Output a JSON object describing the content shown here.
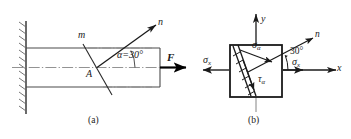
{
  "figure": {
    "captions": {
      "a": "(a)",
      "b": "(b)"
    },
    "panel_a": {
      "name": "cantilever-bar-panel",
      "support": "fixed-wall-hatched",
      "labels": {
        "section_top": "m",
        "section_point": "A",
        "normal_axis": "n",
        "angle": "α=30°",
        "force": "F"
      },
      "angle_value": 30,
      "angle_unit": "degree"
    },
    "panel_b": {
      "name": "stress-element-panel",
      "labels": {
        "axis_y": "y",
        "axis_x": "x",
        "normal_axis": "n",
        "angle": "30°",
        "sigma_alpha": "σ",
        "sigma_alpha_sub": "α",
        "tau_alpha": "τ",
        "tau_alpha_sub": "α",
        "sigma_x_left": "σ",
        "sigma_x_left_sub": "x",
        "sigma_x_right": "σ",
        "sigma_x_right_sub": "x"
      },
      "angle_value": 30,
      "angle_unit": "degree"
    },
    "colors": {
      "ink": "#1a1a1a",
      "line": "#3a3a3a",
      "thin": "#555555",
      "background": "#ffffff"
    }
  }
}
